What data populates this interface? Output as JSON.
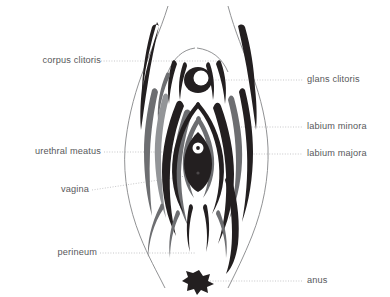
{
  "figure": {
    "type": "anatomical-diagram",
    "background_color": "#ffffff",
    "label_color": "#58585b",
    "leader_line_color": "#b9b9bb",
    "outline_color": "#6d6e71",
    "fill_dark": "#231f20",
    "fill_mid": "#6d6e71",
    "fill_light": "#939598"
  },
  "labels": {
    "left": [
      {
        "id": "corpus-clitoris",
        "text": "corpus clitoris",
        "x": 97,
        "y": 61,
        "leader_to_x": 222,
        "leader_to_y": 61
      },
      {
        "id": "urethral-meatus",
        "text": "urethral meatus",
        "x": 101,
        "y": 152,
        "leader_to_x": 198,
        "leader_to_y": 152
      },
      {
        "id": "vagina",
        "text": "vagina",
        "x": 89,
        "y": 190,
        "leader_to_x": 187,
        "leader_to_y": 174
      },
      {
        "id": "perineum",
        "text": "perineum",
        "x": 97,
        "y": 253,
        "leader_to_x": 196,
        "leader_to_y": 253
      }
    ],
    "right": [
      {
        "id": "glans-clitoris",
        "text": "glans clitoris",
        "x": 307,
        "y": 80,
        "leader_from_x": 207,
        "leader_from_y": 80
      },
      {
        "id": "labium-minora",
        "text": "labium minora",
        "x": 307,
        "y": 127,
        "leader_from_x": 243,
        "leader_from_y": 127
      },
      {
        "id": "labium-majora",
        "text": "labium majora",
        "x": 307,
        "y": 154,
        "leader_from_x": 253,
        "leader_from_y": 154
      },
      {
        "id": "anus",
        "text": "anus",
        "x": 307,
        "y": 281,
        "leader_from_x": 212,
        "leader_from_y": 281
      }
    ]
  }
}
